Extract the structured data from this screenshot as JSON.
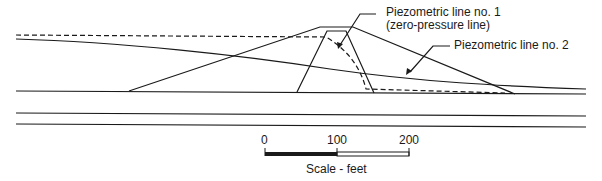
{
  "diagram": {
    "labels": {
      "piezo1_line1": "Piezometric line no. 1",
      "piezo1_line2": "(zero-pressure line)",
      "piezo2": "Piezometric line no. 2"
    },
    "scale": {
      "ticks": [
        "0",
        "100",
        "200"
      ],
      "caption": "Scale - feet",
      "unit": "feet"
    },
    "colors": {
      "line": "#1a1a1a",
      "background": "#ffffff"
    }
  }
}
